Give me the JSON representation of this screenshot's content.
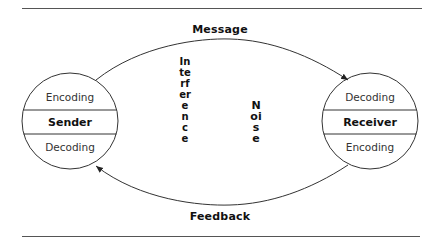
{
  "diagram": {
    "arrows": {
      "message": "Message",
      "feedback": "Feedback"
    },
    "sender": {
      "top": "Encoding",
      "title": "Sender",
      "bottom": "Decoding"
    },
    "receiver": {
      "top": "Decoding",
      "title": "Receiver",
      "bottom": "Encoding"
    },
    "center_labels": {
      "interference": "Interference",
      "noise": "Noise"
    },
    "colors": {
      "stroke": "#333333",
      "rule": "#555555",
      "text": "#111111"
    }
  }
}
